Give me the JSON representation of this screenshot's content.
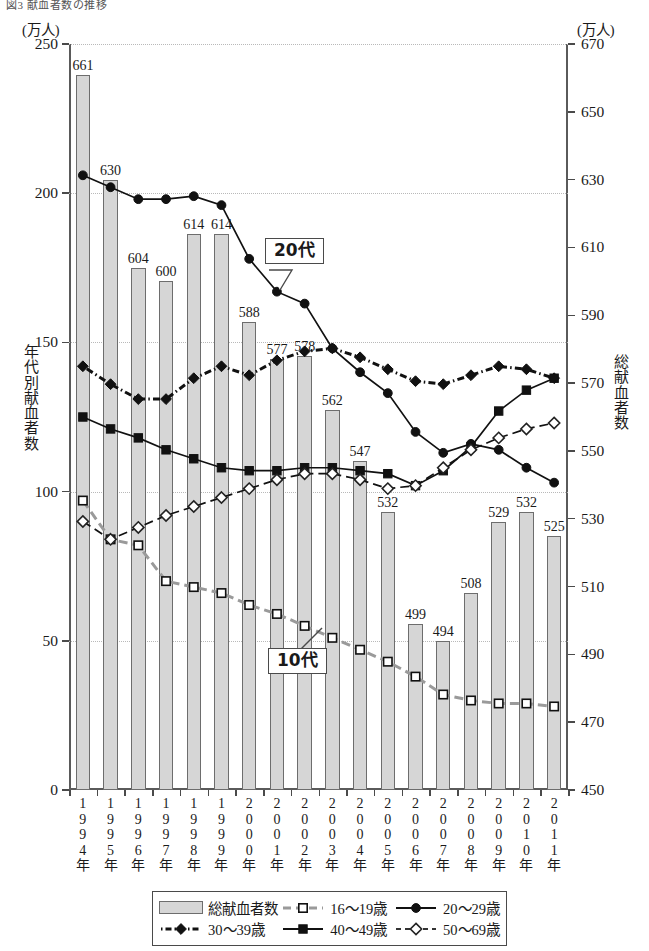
{
  "figure": {
    "title": "図3 献血者数の推移",
    "unit_left": "(万人)",
    "unit_right": "(万人)",
    "axis_title_left": "年代別献血者数",
    "axis_title_right": "総献血者数"
  },
  "callouts": [
    {
      "name": "20代",
      "label": "20代"
    },
    {
      "name": "10代",
      "label": "10代"
    }
  ],
  "legend": {
    "items": [
      {
        "label": "総献血者数",
        "symbol": "bar",
        "color": "#d6d6d6"
      },
      {
        "label": "16〜19歳",
        "symbol": "open-square",
        "color": "#9a9a9a"
      },
      {
        "label": "20〜29歳",
        "symbol": "filled-circle",
        "color": "#111111"
      },
      {
        "label": "30〜39歳",
        "symbol": "filled-diamond",
        "color": "#111111"
      },
      {
        "label": "40〜49歳",
        "symbol": "filled-square",
        "color": "#111111"
      },
      {
        "label": "50〜69歳",
        "symbol": "open-diamond",
        "color": "#333333"
      }
    ]
  },
  "chart_data": {
    "type": "bar",
    "title": "図3 献血者数の推移",
    "xlabel": "",
    "ylabel": "年代別献血者数",
    "y2label": "総献血者数",
    "ylim": [
      0,
      250
    ],
    "y2lim": [
      450,
      670
    ],
    "yticks": [
      0,
      50,
      100,
      150,
      200,
      250
    ],
    "y2ticks": [
      450,
      470,
      490,
      510,
      530,
      550,
      570,
      590,
      610,
      630,
      650,
      670
    ],
    "grid": true,
    "legend_position": "bottom",
    "categories": [
      "1994年",
      "1995年",
      "1996年",
      "1997年",
      "1998年",
      "1999年",
      "2000年",
      "2001年",
      "2002年",
      "2003年",
      "2004年",
      "2005年",
      "2006年",
      "2007年",
      "2008年",
      "2009年",
      "2010年",
      "2011年"
    ],
    "bars": {
      "name": "総献血者数",
      "axis": "right",
      "unit": "万人",
      "values": [
        661,
        630,
        604,
        600,
        614,
        614,
        588,
        577,
        578,
        562,
        547,
        532,
        499,
        494,
        508,
        529,
        532,
        525
      ]
    },
    "series": [
      {
        "name": "16〜19歳",
        "axis": "left",
        "marker": "open-square",
        "linestyle": "dashed",
        "values": [
          97,
          84,
          82,
          70,
          68,
          66,
          62,
          59,
          55,
          51,
          47,
          43,
          38,
          32,
          30,
          29,
          29,
          28
        ]
      },
      {
        "name": "20〜29歳",
        "axis": "left",
        "marker": "filled-circle",
        "linestyle": "solid",
        "values": [
          206,
          202,
          198,
          198,
          199,
          196,
          178,
          167,
          163,
          148,
          140,
          133,
          120,
          113,
          116,
          114,
          108,
          103
        ]
      },
      {
        "name": "30〜39歳",
        "axis": "left",
        "marker": "filled-diamond",
        "linestyle": "dashdot",
        "values": [
          142,
          136,
          131,
          131,
          138,
          142,
          139,
          144,
          147,
          148,
          145,
          141,
          137,
          136,
          139,
          142,
          141,
          138
        ]
      },
      {
        "name": "40〜49歳",
        "axis": "left",
        "marker": "filled-square",
        "linestyle": "solid",
        "values": [
          125,
          121,
          118,
          114,
          111,
          108,
          107,
          107,
          108,
          108,
          107,
          106,
          102,
          107,
          115,
          127,
          134,
          138
        ]
      },
      {
        "name": "50〜69歳",
        "axis": "left",
        "marker": "open-diamond",
        "linestyle": "dashed",
        "values": [
          90,
          84,
          88,
          92,
          95,
          98,
          101,
          104,
          106,
          106,
          104,
          101,
          102,
          108,
          114,
          118,
          121,
          123
        ]
      }
    ]
  }
}
